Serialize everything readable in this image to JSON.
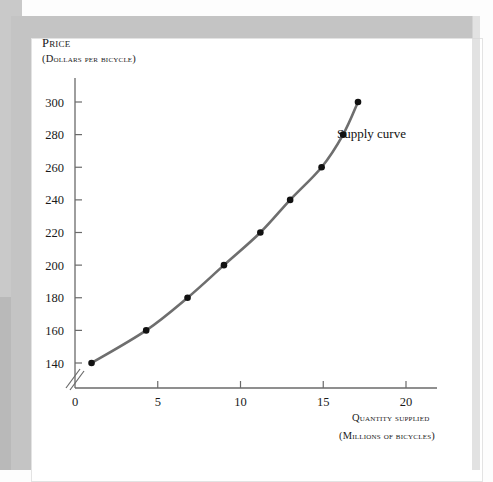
{
  "figure": {
    "background_color": "#ffffff",
    "frame_color": "#c4c4c4",
    "curve_color": "#6e6e6e",
    "marker_color": "#111111",
    "axis_color": "#555555"
  },
  "axes": {
    "y_label_line1": "Price",
    "y_label_line2": "(Dollars per bicycle)",
    "x_label_line1": "Quantity supplied",
    "x_label_line2": "(Millions of bicycles)",
    "y_ticks": [
      "140",
      "160",
      "180",
      "200",
      "220",
      "240",
      "260",
      "280",
      "300"
    ],
    "x_ticks": [
      "0",
      "5",
      "10",
      "15",
      "20"
    ],
    "axis_break": "yes"
  },
  "annotations": {
    "series_label": "Supply curve"
  },
  "chart_data": {
    "type": "line",
    "title": "",
    "xlabel": "Quantity supplied (millions of bicycles)",
    "ylabel": "Price (dollars per bicycle)",
    "xlim": [
      0,
      22.5
    ],
    "ylim": [
      130,
      310
    ],
    "y_axis_break_below": 140,
    "grid": false,
    "legend": "none",
    "x_ticks": [
      0,
      5,
      10,
      15,
      20
    ],
    "y_ticks": [
      140,
      160,
      180,
      220,
      240,
      260,
      280,
      300
    ],
    "series": [
      {
        "name": "Supply curve",
        "marker": "filled-circle",
        "line_color": "#6e6e6e",
        "x": [
          1.0,
          4.3,
          6.8,
          9.0,
          11.2,
          13.0,
          14.9,
          16.2,
          17.1
        ],
        "y": [
          140,
          160,
          180,
          200,
          220,
          240,
          260,
          280,
          300
        ],
        "points": [
          {
            "quantity": 1.0,
            "price": 140
          },
          {
            "quantity": 4.3,
            "price": 160
          },
          {
            "quantity": 6.8,
            "price": 180
          },
          {
            "quantity": 9.0,
            "price": 200
          },
          {
            "quantity": 11.2,
            "price": 220
          },
          {
            "quantity": 13.0,
            "price": 240
          },
          {
            "quantity": 14.9,
            "price": 260
          },
          {
            "quantity": 16.2,
            "price": 280
          },
          {
            "quantity": 17.1,
            "price": 300
          }
        ]
      }
    ]
  }
}
